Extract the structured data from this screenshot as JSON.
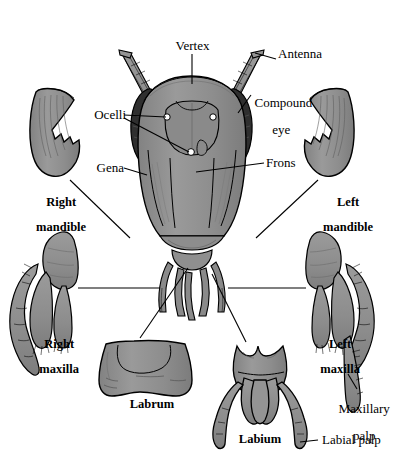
{
  "figure": {
    "colors": {
      "background": "#ffffff",
      "cuticle_fill": "#8f8f8f",
      "cuticle_fill_light": "#9c9c9c",
      "cuticle_fill_dark": "#777777",
      "compound_eye": "#2f2f2f",
      "outline": "#000000",
      "ocellus": "#ffffff",
      "leader_line": "#000000"
    }
  },
  "labels": {
    "vertex": "Vertex",
    "antenna": "Antenna",
    "compound_eye_line1": "Compound",
    "compound_eye_line2": "eye",
    "ocelli": "Ocelli",
    "gena": "Gena",
    "frons": "Frons",
    "right_mandible_line1": "Right",
    "right_mandible_line2": "mandible",
    "left_mandible_line1": "Left",
    "left_mandible_line2": "mandible",
    "right_maxilla_line1": "Right",
    "right_maxilla_line2": "maxilla",
    "left_maxilla_line1": "Left",
    "left_maxilla_line2": "maxilla",
    "labrum": "Labrum",
    "labium": "Labium",
    "maxillary_palp_line1": "Maxillary",
    "maxillary_palp_line2": "palp",
    "labial_palp": "Labial palp"
  },
  "parts": [
    {
      "name": "head-capsule",
      "label": "Head capsule"
    },
    {
      "name": "antenna-left",
      "label": "Antenna"
    },
    {
      "name": "antenna-right",
      "label": "Antenna"
    },
    {
      "name": "compound-eye-left",
      "label": "Compound eye"
    },
    {
      "name": "compound-eye-right",
      "label": "Compound eye"
    },
    {
      "name": "ocellus-left",
      "label": "Ocellus"
    },
    {
      "name": "ocellus-right",
      "label": "Ocellus"
    },
    {
      "name": "ocellus-median",
      "label": "Ocellus"
    },
    {
      "name": "gena",
      "label": "Gena"
    },
    {
      "name": "frons",
      "label": "Frons"
    },
    {
      "name": "vertex",
      "label": "Vertex"
    },
    {
      "name": "right-mandible",
      "label": "Right mandible"
    },
    {
      "name": "left-mandible",
      "label": "Left mandible"
    },
    {
      "name": "right-maxilla",
      "label": "Right maxilla"
    },
    {
      "name": "left-maxilla",
      "label": "Left maxilla"
    },
    {
      "name": "labrum",
      "label": "Labrum"
    },
    {
      "name": "labium",
      "label": "Labium"
    },
    {
      "name": "maxillary-palp",
      "label": "Maxillary palp"
    },
    {
      "name": "labial-palp",
      "label": "Labial palp"
    }
  ]
}
